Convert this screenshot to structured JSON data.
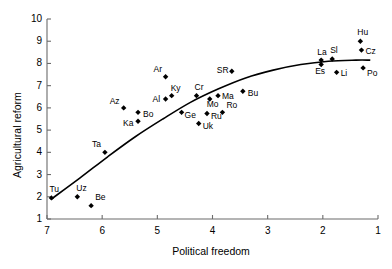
{
  "chart_data": {
    "type": "scatter",
    "title": "",
    "xlabel": "Political freedom",
    "ylabel": "Agricultural reform",
    "xlim": [
      7,
      1
    ],
    "ylim": [
      1,
      10
    ],
    "x_reversed": true,
    "grid": false,
    "legend": "none",
    "xticks": [
      7,
      6,
      5,
      4,
      3,
      2,
      1
    ],
    "yticks": [
      1,
      2,
      3,
      4,
      5,
      6,
      7,
      8,
      9,
      10
    ],
    "marker": "filled-diamond",
    "marker_color": "#000000",
    "line_color": "#000000",
    "points": [
      {
        "label": "Tu",
        "x": 6.92,
        "y": 1.95,
        "lx": -2,
        "ly": -13
      },
      {
        "label": "Uz",
        "x": 6.45,
        "y": 2.0,
        "lx": -1,
        "ly": -13
      },
      {
        "label": "Be",
        "x": 6.2,
        "y": 1.6,
        "lx": 4,
        "ly": -13
      },
      {
        "label": "Ta",
        "x": 5.95,
        "y": 4.0,
        "lx": -13,
        "ly": -12
      },
      {
        "label": "Az",
        "x": 5.61,
        "y": 6.0,
        "lx": -14,
        "ly": -11
      },
      {
        "label": "Bo",
        "x": 5.35,
        "y": 5.8,
        "lx": 5,
        "ly": -2
      },
      {
        "label": "Ka",
        "x": 5.35,
        "y": 5.4,
        "lx": -15,
        "ly": -2
      },
      {
        "label": "Ar",
        "x": 4.85,
        "y": 7.4,
        "lx": -12,
        "ly": -12
      },
      {
        "label": "Al",
        "x": 4.85,
        "y": 6.4,
        "lx": -13,
        "ly": -4
      },
      {
        "label": "Ky",
        "x": 4.74,
        "y": 6.55,
        "lx": -1,
        "ly": -12
      },
      {
        "label": "Cr",
        "x": 4.29,
        "y": 6.55,
        "lx": -2,
        "ly": -13
      },
      {
        "label": "Ge",
        "x": 4.56,
        "y": 5.8,
        "lx": 3,
        "ly": -1
      },
      {
        "label": "Uk",
        "x": 4.25,
        "y": 5.3,
        "lx": 4,
        "ly": -1
      },
      {
        "label": "Ru",
        "x": 4.1,
        "y": 5.75,
        "lx": 4,
        "ly": -1
      },
      {
        "label": "Mo",
        "x": 4.05,
        "y": 6.4,
        "lx": -3,
        "ly": 1
      },
      {
        "label": "Ma",
        "x": 3.9,
        "y": 6.55,
        "lx": 4,
        "ly": -4
      },
      {
        "label": "Ro",
        "x": 3.82,
        "y": 5.8,
        "lx": 4,
        "ly": -11
      },
      {
        "label": "SR",
        "x": 3.65,
        "y": 7.65,
        "lx": -15,
        "ly": -5
      },
      {
        "label": "Bu",
        "x": 3.45,
        "y": 6.75,
        "lx": 5,
        "ly": -2
      },
      {
        "label": "La",
        "x": 2.03,
        "y": 8.15,
        "lx": -4,
        "ly": -12
      },
      {
        "label": "Es",
        "x": 2.03,
        "y": 7.95,
        "lx": -6,
        "ly": 2
      },
      {
        "label": "Sl",
        "x": 1.83,
        "y": 8.2,
        "lx": -2,
        "ly": -13
      },
      {
        "label": "Li",
        "x": 1.75,
        "y": 7.6,
        "lx": 4,
        "ly": -3
      },
      {
        "label": "Hu",
        "x": 1.32,
        "y": 9.0,
        "lx": -3,
        "ly": -13
      },
      {
        "label": "Cz",
        "x": 1.3,
        "y": 8.6,
        "lx": 4,
        "ly": -3
      },
      {
        "label": "Po",
        "x": 1.27,
        "y": 7.8,
        "lx": 4,
        "ly": 1
      }
    ],
    "trend_line": [
      {
        "x": 6.92,
        "y": 1.9
      },
      {
        "x": 6.4,
        "y": 2.85
      },
      {
        "x": 5.9,
        "y": 3.8
      },
      {
        "x": 5.4,
        "y": 4.7
      },
      {
        "x": 4.9,
        "y": 5.5
      },
      {
        "x": 4.4,
        "y": 6.25
      },
      {
        "x": 3.9,
        "y": 6.85
      },
      {
        "x": 3.4,
        "y": 7.35
      },
      {
        "x": 2.9,
        "y": 7.7
      },
      {
        "x": 2.4,
        "y": 7.95
      },
      {
        "x": 1.9,
        "y": 8.1
      },
      {
        "x": 1.4,
        "y": 8.15
      },
      {
        "x": 1.15,
        "y": 8.15
      }
    ]
  }
}
